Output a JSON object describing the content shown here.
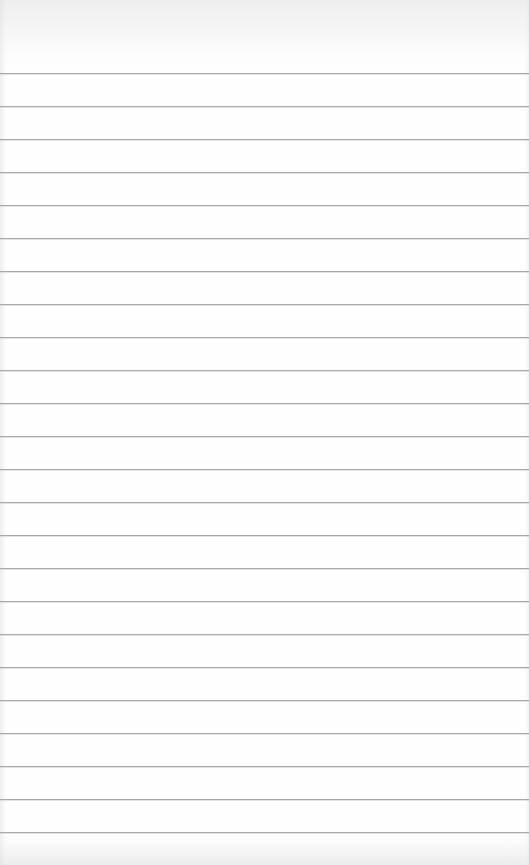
{
  "paper": {
    "type": "lined-paper",
    "background_color": "#fefefe",
    "rule_color": "#a9a9a9",
    "first_rule_y": 73,
    "rule_spacing": 33,
    "rule_count": 24,
    "text": ""
  }
}
